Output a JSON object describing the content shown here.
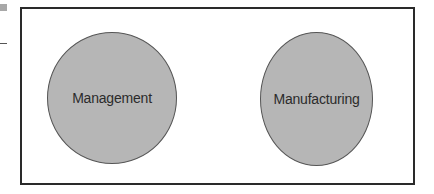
{
  "diagram": {
    "type": "set-diagram",
    "shapes": [
      {
        "id": "c1",
        "shape": "circle",
        "label": "Management",
        "fill": "#b6b6b6",
        "stroke": "#555555"
      },
      {
        "id": "c2",
        "shape": "circle",
        "label": "Manufacturing",
        "fill": "#b6b6b6",
        "stroke": "#555555"
      }
    ],
    "frame": {
      "stroke": "#2a2a2a",
      "fill": "#ffffff"
    },
    "overlap": false
  }
}
